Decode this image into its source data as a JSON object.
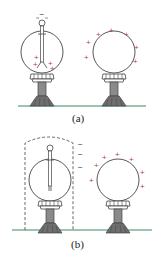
{
  "panels": [
    {
      "label": "(a)",
      "electroscope_top_charge": "−",
      "leaf_charges": [
        "+",
        "+",
        "+",
        "+"
      ],
      "sphere_charges": [
        "+",
        "+",
        "+",
        "+",
        "+",
        "+",
        "+",
        "+"
      ]
    },
    {
      "label": "(b)",
      "shield_charges": [
        "−",
        "−",
        "−"
      ],
      "sphere_charges": [
        "+",
        "+",
        "+",
        "+",
        "+",
        "+",
        "+"
      ]
    }
  ],
  "colors": {
    "outline": "#444444",
    "positive": "#b03a3a",
    "negative": "#333333",
    "ground": "#3a8a5a",
    "pedestal": "#888888",
    "base": "#6e6e6e"
  }
}
